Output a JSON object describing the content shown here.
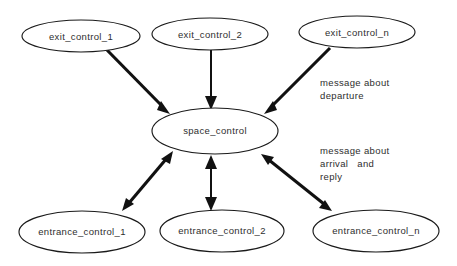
{
  "diagram": {
    "background_color": "#ffffff",
    "stroke_color": "#1a1a1a",
    "text_color": "#2e2e2e",
    "nodes": [
      {
        "id": "exit_control_1",
        "label": "exit_control_1",
        "cx": 81,
        "cy": 36,
        "rx": 59,
        "ry": 16
      },
      {
        "id": "exit_control_2",
        "label": "exit_control_2",
        "cx": 210,
        "cy": 34,
        "rx": 58,
        "ry": 16
      },
      {
        "id": "exit_control_n",
        "label": "exit_control_n",
        "cx": 357,
        "cy": 32,
        "rx": 58,
        "ry": 16
      },
      {
        "id": "space_control",
        "label": "space_control",
        "cx": 215,
        "cy": 131,
        "rx": 63,
        "ry": 23
      },
      {
        "id": "entrance_control_1",
        "label": "entrance_control_1",
        "cx": 82,
        "cy": 232,
        "rx": 63,
        "ry": 21
      },
      {
        "id": "entrance_control_2",
        "label": "entrance_control_2",
        "cx": 222,
        "cy": 231,
        "rx": 62,
        "ry": 21
      },
      {
        "id": "entrance_control_n",
        "label": "entrance_control_n",
        "cx": 376,
        "cy": 231,
        "rx": 63,
        "ry": 21
      }
    ],
    "edges": [
      {
        "id": "edge-exit1-space",
        "from": "exit_control_1",
        "to": "space_control",
        "direction": "one-way",
        "weight": "thick"
      },
      {
        "id": "edge-exit2-space",
        "from": "exit_control_2",
        "to": "space_control",
        "direction": "one-way",
        "weight": "thin"
      },
      {
        "id": "edge-exitn-space",
        "from": "exit_control_n",
        "to": "space_control",
        "direction": "one-way",
        "weight": "thick"
      },
      {
        "id": "edge-space-entrance1",
        "from": "space_control",
        "to": "entrance_control_1",
        "direction": "two-way",
        "weight": "thick"
      },
      {
        "id": "edge-space-entrance2",
        "from": "space_control",
        "to": "entrance_control_2",
        "direction": "two-way",
        "weight": "thin"
      },
      {
        "id": "edge-space-entrancen",
        "from": "space_control",
        "to": "entrance_control_n",
        "direction": "two-way",
        "weight": "thick"
      }
    ],
    "annotations": [
      {
        "id": "annotation-departure",
        "x": 320,
        "y": 86,
        "lines": [
          "message about",
          "departure"
        ]
      },
      {
        "id": "annotation-arrival-reply",
        "x": 320,
        "y": 154,
        "lines": [
          "message about",
          "arrival   and",
          "reply"
        ]
      }
    ]
  }
}
